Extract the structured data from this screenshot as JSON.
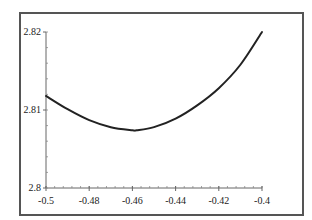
{
  "chart_data": {
    "type": "line",
    "title": "",
    "xlabel": "",
    "ylabel": "",
    "xlim": [
      -0.5,
      -0.4
    ],
    "ylim": [
      2.8,
      2.82
    ],
    "grid": false,
    "legend": null,
    "x_ticks": [
      "-0.5",
      "-0.48",
      "-0.46",
      "-0.44",
      "-0.42",
      "-0.4"
    ],
    "x_tick_values": [
      -0.5,
      -0.48,
      -0.46,
      -0.44,
      -0.42,
      -0.4
    ],
    "y_ticks": [
      "2.8",
      "2.81",
      "2.82"
    ],
    "y_tick_values": [
      2.8,
      2.81,
      2.82
    ],
    "series": [
      {
        "name": "curve",
        "color": "#222222",
        "x": [
          -0.5,
          -0.49,
          -0.48,
          -0.47,
          -0.46,
          -0.458,
          -0.45,
          -0.44,
          -0.43,
          -0.42,
          -0.41,
          -0.4
        ],
        "y": [
          2.8118,
          2.8101,
          2.8087,
          2.8078,
          2.8074,
          2.8074,
          2.8078,
          2.8089,
          2.8106,
          2.8128,
          2.8158,
          2.82
        ]
      }
    ]
  }
}
